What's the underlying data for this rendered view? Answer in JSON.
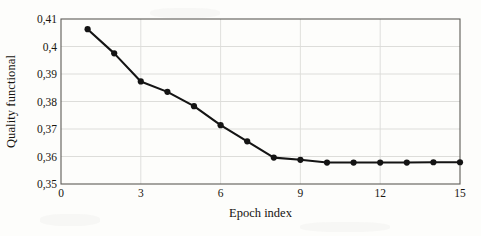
{
  "chart_data": {
    "type": "line",
    "title": "",
    "xlabel": "Epoch index",
    "ylabel": "Quality functional",
    "xlim": [
      0,
      15
    ],
    "ylim": [
      0.35,
      0.41
    ],
    "grid": true,
    "legend": "none",
    "marker": "filled-circle",
    "line_color": "#141414",
    "marker_color": "#141414",
    "decimal_separator": ",",
    "x_ticks": [
      "0",
      "3",
      "6",
      "9",
      "12",
      "15"
    ],
    "x_tick_values": [
      0,
      3,
      6,
      9,
      12,
      15
    ],
    "y_ticks": [
      "0,35",
      "0,36",
      "0,37",
      "0,38",
      "0,39",
      "0,4",
      "0,41"
    ],
    "y_tick_values": [
      0.35,
      0.36,
      0.37,
      0.38,
      0.39,
      0.4,
      0.41
    ],
    "x": [
      1,
      2,
      3,
      4,
      5,
      6,
      7,
      8,
      9,
      10,
      11,
      12,
      13,
      14,
      15
    ],
    "values": [
      0.4063,
      0.3975,
      0.3873,
      0.3835,
      0.3783,
      0.3714,
      0.3655,
      0.3596,
      0.3588,
      0.3578,
      0.3578,
      0.3578,
      0.3578,
      0.3579,
      0.3579
    ],
    "series": [
      {
        "name": "Quality functional",
        "values": [
          0.4063,
          0.3975,
          0.3873,
          0.3835,
          0.3783,
          0.3714,
          0.3655,
          0.3596,
          0.3588,
          0.3578,
          0.3578,
          0.3578,
          0.3578,
          0.3579,
          0.3579
        ]
      }
    ]
  }
}
